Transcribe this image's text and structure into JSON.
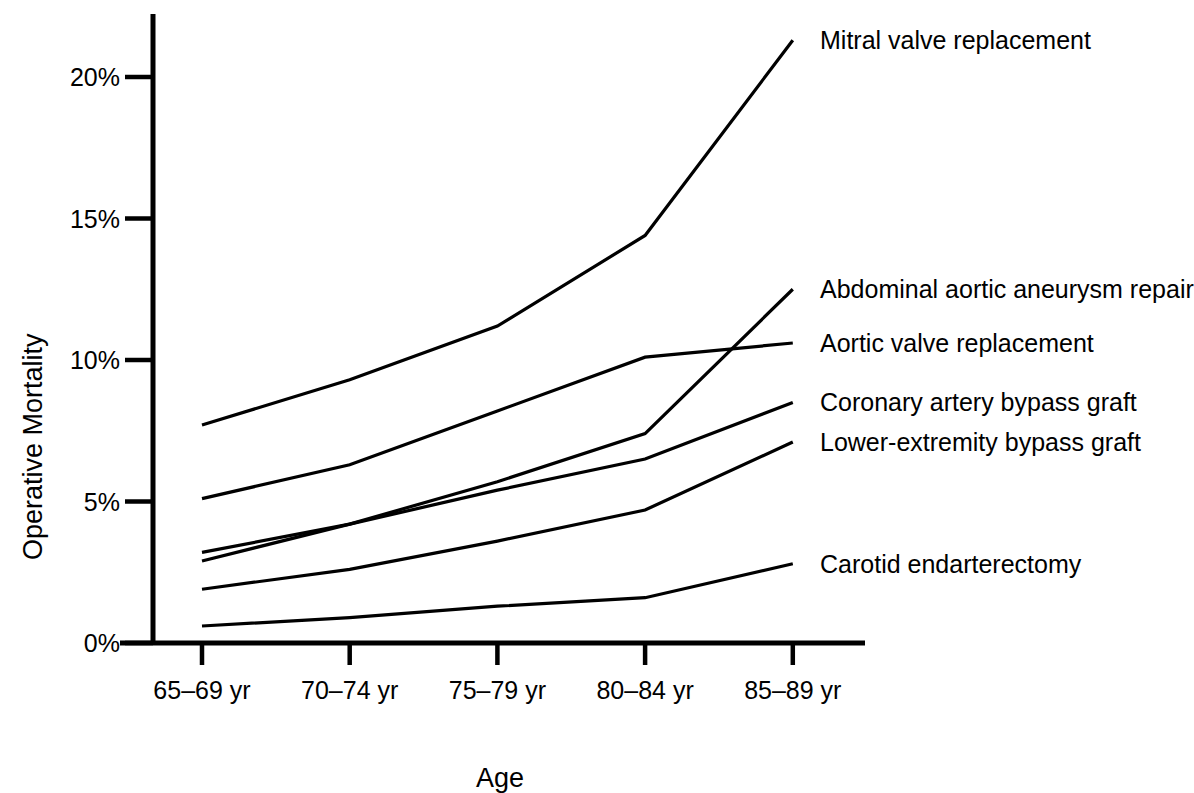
{
  "chart_data": {
    "type": "line",
    "title": "",
    "xlabel": "Age",
    "ylabel": "Operative Mortality",
    "categories": [
      "65–69 yr",
      "70–74 yr",
      "75–79 yr",
      "80–84 yr",
      "85–89 yr"
    ],
    "ytick_labels": [
      "0%",
      "5%",
      "10%",
      "15%",
      "20%"
    ],
    "ytick_values": [
      0,
      5,
      10,
      15,
      20
    ],
    "ylim": [
      0,
      22.5
    ],
    "grid": false,
    "legend_position": "right-inline",
    "line_color": "#000000",
    "series": [
      {
        "name": "Mitral valve replacement",
        "values": [
          7.7,
          9.3,
          11.2,
          14.4,
          21.3
        ]
      },
      {
        "name": "Abdominal aortic aneurysm repair",
        "values": [
          5.1,
          6.3,
          8.2,
          10.1,
          10.6
        ]
      },
      {
        "name": "Aortic valve replacement",
        "values": [
          3.2,
          4.2,
          5.7,
          7.4,
          12.5
        ]
      },
      {
        "name": "Coronary artery bypass graft",
        "values": [
          2.9,
          4.2,
          5.4,
          6.5,
          8.5
        ]
      },
      {
        "name": "Lower-extremity bypass graft",
        "values": [
          1.9,
          2.6,
          3.6,
          4.7,
          7.1
        ]
      },
      {
        "name": "Carotid endarterectomy",
        "values": [
          0.6,
          0.9,
          1.3,
          1.6,
          2.8
        ]
      }
    ],
    "label_anchors": [
      {
        "name": "Mitral valve replacement",
        "y_pct": 21.3
      },
      {
        "name": "Abdominal aortic aneurysm repair",
        "y_pct": 12.5
      },
      {
        "name": "Aortic valve replacement",
        "y_pct": 10.6
      },
      {
        "name": "Coronary artery bypass graft",
        "y_pct": 8.5
      },
      {
        "name": "Lower-extremity bypass graft",
        "y_pct": 7.1
      },
      {
        "name": "Carotid endarterectomy",
        "y_pct": 2.8
      }
    ]
  }
}
